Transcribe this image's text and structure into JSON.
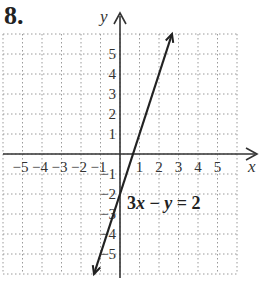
{
  "problem_number": "8.",
  "chart_data": {
    "type": "line",
    "title": "8.",
    "xlabel": "x",
    "ylabel": "y",
    "xlim": [
      -6,
      6
    ],
    "ylim": [
      -6,
      6
    ],
    "grid": true,
    "grid_style": "dotted",
    "x_ticks": [
      -5,
      -4,
      -3,
      -2,
      -1,
      1,
      2,
      3,
      4,
      5
    ],
    "x_tick_labels": [
      "−5",
      "−4",
      "−3",
      "−2",
      "−1",
      "1",
      "2",
      "3",
      "4",
      "5"
    ],
    "y_ticks": [
      5,
      4,
      3,
      2,
      1,
      -1,
      -2,
      -3,
      -4,
      -5
    ],
    "y_tick_labels": [
      "5",
      "4",
      "3",
      "2",
      "1",
      "−1",
      "−2",
      "−3",
      "−4",
      "−5"
    ],
    "series": [
      {
        "name": "3x − y = 2",
        "equation": "y = 3x - 2",
        "slope": 3,
        "y_intercept": -2,
        "x": [
          -1.333,
          2.667
        ],
        "y": [
          -6,
          6
        ],
        "arrows": "both"
      }
    ],
    "annotations": [
      {
        "text": "3x − y = 2",
        "x": 1.3,
        "y": -2.5
      }
    ]
  },
  "labels": {
    "x_axis": "x",
    "y_axis": "y",
    "equation_parts": [
      "3",
      "x",
      " − ",
      "y",
      " = 2"
    ]
  },
  "colors": {
    "axis": "#333333",
    "grid": "#9a9a9a",
    "line": "#222222"
  }
}
